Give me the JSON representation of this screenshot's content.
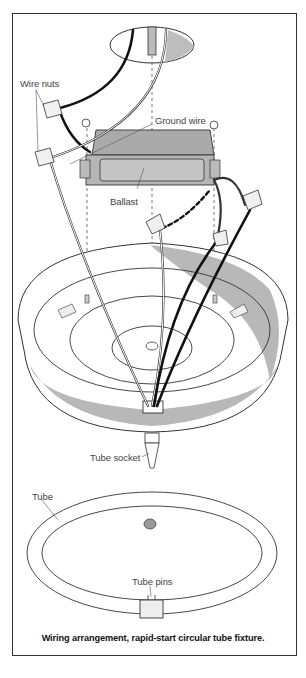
{
  "diagram": {
    "title": "Wiring arrangement, rapid-start circular tube fixture.",
    "labels": {
      "wire_nuts": "Wire nuts",
      "ground_wire": "Ground wire",
      "ballast": "Ballast",
      "tube_socket": "Tube socket",
      "tube": "Tube",
      "tube_pins": "Tube pins"
    },
    "colors": {
      "outline": "#333333",
      "shade": "#b5b5b5",
      "light_shade": "#e2e2e2",
      "wire_black": "#111111"
    }
  }
}
